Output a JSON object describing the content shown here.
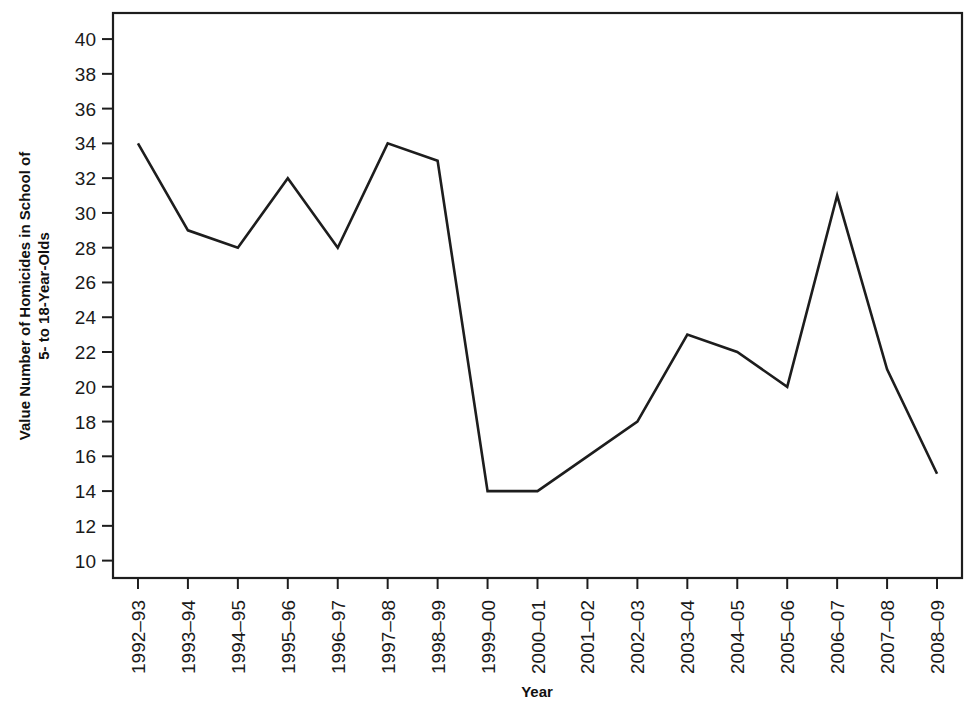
{
  "chart_data": {
    "type": "line",
    "title": "",
    "xlabel": "Year",
    "ylabel": "Value Number of Homicides in School of 5- to 18-Year-Olds",
    "ylabel_lines": [
      "Value Number of Homicides in School of",
      "5- to 18-Year-Olds"
    ],
    "categories": [
      "1992–93",
      "1993–94",
      "1994–95",
      "1995–96",
      "1996–97",
      "1997–98",
      "1998–99",
      "1999–00",
      "2000–01",
      "2001–02",
      "2002–03",
      "2003–04",
      "2004–05",
      "2005–06",
      "2006–07",
      "2007–08",
      "2008–09"
    ],
    "values": [
      34,
      29,
      28,
      32,
      28,
      34,
      33,
      14,
      14,
      16,
      18,
      23,
      22,
      20,
      31,
      21,
      15
    ],
    "ylim": [
      9,
      41.5
    ],
    "yticks": [
      10,
      12,
      14,
      16,
      18,
      20,
      22,
      24,
      26,
      28,
      30,
      32,
      34,
      36,
      38,
      40
    ],
    "ytick_labels": [
      "10",
      "12",
      "14",
      "16",
      "18",
      "20",
      "22",
      "24",
      "26",
      "28",
      "30",
      "32",
      "34",
      "36",
      "38",
      "40"
    ],
    "grid": false,
    "legend": null,
    "series": [
      {
        "name": "Number of Homicides in School of 5- to 18-Year-Olds",
        "color": "#1d1d1d",
        "values": [
          34,
          29,
          28,
          32,
          28,
          34,
          33,
          14,
          14,
          16,
          18,
          23,
          22,
          20,
          31,
          21,
          15
        ]
      }
    ],
    "colors": {
      "line": "#1d1d1d",
      "frame": "#1d1d1d",
      "text": "#1a1a1a",
      "background": "#ffffff"
    }
  }
}
